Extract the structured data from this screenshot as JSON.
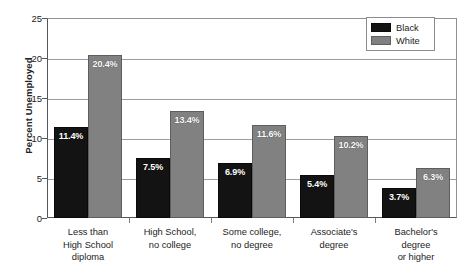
{
  "chart_data": {
    "type": "bar",
    "title": "",
    "subtitle": "",
    "xlabel": "",
    "ylabel": "Percent Unemployed",
    "ylim": [
      0,
      25
    ],
    "yticks": [
      0,
      5,
      10,
      15,
      20,
      25
    ],
    "ytick_labels": [
      "0",
      "5",
      "10",
      "15",
      "20",
      "25"
    ],
    "grid": "horizontal",
    "legend_position": "top-right",
    "categories": [
      "Less than\nHigh School\ndiploma",
      "High School,\nno college",
      "Some college,\nno degree",
      "Associate's\ndegree",
      "Bachelor's\ndegree\nor higher"
    ],
    "series": [
      {
        "name": "Black",
        "color": "#131313",
        "values": [
          11.4,
          7.5,
          6.9,
          5.4,
          3.7
        ],
        "data_labels": [
          "11.4%",
          "7.5%",
          "6.9%",
          "5.4%",
          "3.7%"
        ]
      },
      {
        "name": "White",
        "color": "#818181",
        "values": [
          20.4,
          13.4,
          11.6,
          10.2,
          6.3
        ],
        "data_labels": [
          "20.4%",
          "13.4%",
          "11.6%",
          "10.2%",
          "6.3%"
        ]
      }
    ]
  },
  "axis": {
    "y_title": "Percent Unemployed"
  },
  "legend": {
    "items": [
      {
        "label": "Black",
        "color": "#131313"
      },
      {
        "label": "White",
        "color": "#818181"
      }
    ]
  },
  "categories_lines": [
    [
      "Less than",
      "High School",
      "diploma"
    ],
    [
      "High School,",
      "no college"
    ],
    [
      "Some college,",
      "no degree"
    ],
    [
      "Associate's",
      "degree"
    ],
    [
      "Bachelor's",
      "degree",
      "or higher"
    ]
  ]
}
